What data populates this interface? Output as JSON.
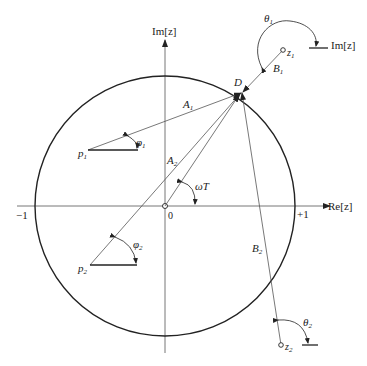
{
  "diagram": {
    "axes": {
      "real_label": "Re[z]",
      "imag_label": "Im[z]",
      "origin_label": "0",
      "minus_one_label": "−1",
      "plus_one_label": "+1"
    },
    "unit_circle": {
      "center": [
        165,
        206
      ],
      "radius": 130
    },
    "points": {
      "D": {
        "label": "D",
        "pos": [
          242,
          92
        ]
      },
      "p1": {
        "label": "p",
        "sub": "1",
        "pos": [
          88,
          150
        ]
      },
      "p2": {
        "label": "p",
        "sub": "2",
        "pos": [
          90,
          265
        ]
      },
      "z1": {
        "label": "z",
        "sub": "1",
        "pos": [
          283,
          50
        ]
      },
      "z2": {
        "label": "z",
        "sub": "2",
        "pos": [
          281,
          345
        ]
      }
    },
    "vectors": {
      "A1": {
        "label": "A",
        "sub": "1"
      },
      "A2": {
        "label": "A",
        "sub": "2"
      },
      "B1": {
        "label": "B",
        "sub": "1"
      },
      "B2": {
        "label": "B",
        "sub": "2"
      }
    },
    "angles": {
      "phi1": {
        "label": "φ",
        "sub": "1"
      },
      "phi2": {
        "label": "φ",
        "sub": "2"
      },
      "theta1": {
        "label": "θ",
        "sub": "1"
      },
      "theta2": {
        "label": "θ",
        "sub": "2"
      },
      "omegaT": {
        "label": "ωT"
      }
    },
    "z1_ref_label": "Im[z]"
  }
}
